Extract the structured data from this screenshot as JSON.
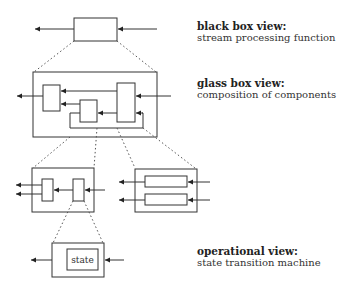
{
  "views": [
    {
      "title": "black box view:",
      "description": "stream processing function"
    },
    {
      "title": "glass box view:",
      "description": "composition of components"
    },
    {
      "title": "operational view:",
      "description": "state transition machine"
    }
  ],
  "state_box_label": "state",
  "colors": {
    "stroke": "#333333",
    "dotted": "#555555",
    "background": "#ffffff"
  }
}
